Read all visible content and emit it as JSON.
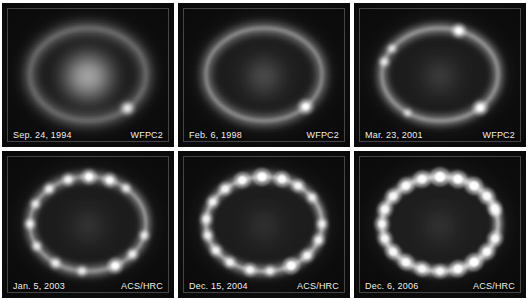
{
  "figure": {
    "name": "supernova-1987a-ring-evolution-montage",
    "background_color": "#ffffff",
    "panel_background_color": "#050505",
    "label_color": "#f2f2f2",
    "grid": {
      "columns": 3,
      "rows": 2
    }
  },
  "panels": [
    {
      "id": "panel-1",
      "date": "Sep. 24, 1994",
      "instrument": "WFPC2",
      "ring": {
        "center_glow": true,
        "center_glow_intensity": 0.95,
        "ring_brightness": 0.42,
        "ring_blur": 5.2,
        "knot_count": 1,
        "knots": [
          {
            "angle": 47,
            "size": 4.0,
            "intensity": 0.95
          }
        ]
      }
    },
    {
      "id": "panel-2",
      "date": "Feb. 6, 1998",
      "instrument": "WFPC2",
      "ring": {
        "center_glow": true,
        "center_glow_intensity": 0.4,
        "ring_brightness": 0.5,
        "ring_blur": 4.0,
        "knot_count": 1,
        "knots": [
          {
            "angle": 44,
            "size": 4.4,
            "intensity": 1.0
          }
        ]
      }
    },
    {
      "id": "panel-3",
      "date": "Mar. 23, 2001",
      "instrument": "WFPC2",
      "ring": {
        "center_glow": true,
        "center_glow_intensity": 0.26,
        "ring_brightness": 0.52,
        "ring_blur": 3.6,
        "knot_count": 5,
        "knots": [
          {
            "angle": 289,
            "size": 4.2,
            "intensity": 1.0
          },
          {
            "angle": 46,
            "size": 4.4,
            "intensity": 1.0
          },
          {
            "angle": 196,
            "size": 3.4,
            "intensity": 0.72
          },
          {
            "angle": 214,
            "size": 3.2,
            "intensity": 0.68
          },
          {
            "angle": 124,
            "size": 3.0,
            "intensity": 0.6
          }
        ]
      }
    },
    {
      "id": "panel-4",
      "date": "Jan. 5, 2003",
      "instrument": "ACS/HRC",
      "ring": {
        "center_glow": true,
        "center_glow_intensity": 0.18,
        "ring_brightness": 0.5,
        "ring_blur": 3.0,
        "knot_count": 13,
        "knots": [
          {
            "angle": 271,
            "size": 4.4,
            "intensity": 1.0
          },
          {
            "angle": 292,
            "size": 4.2,
            "intensity": 0.95
          },
          {
            "angle": 250,
            "size": 3.8,
            "intensity": 0.85
          },
          {
            "angle": 311,
            "size": 3.4,
            "intensity": 0.72
          },
          {
            "angle": 228,
            "size": 3.6,
            "intensity": 0.8
          },
          {
            "angle": 205,
            "size": 3.4,
            "intensity": 0.72
          },
          {
            "angle": 180,
            "size": 3.6,
            "intensity": 0.8
          },
          {
            "angle": 152,
            "size": 3.4,
            "intensity": 0.7
          },
          {
            "angle": 124,
            "size": 3.6,
            "intensity": 0.78
          },
          {
            "angle": 96,
            "size": 3.4,
            "intensity": 0.72
          },
          {
            "angle": 62,
            "size": 4.4,
            "intensity": 1.0
          },
          {
            "angle": 40,
            "size": 3.6,
            "intensity": 0.78
          },
          {
            "angle": 14,
            "size": 3.4,
            "intensity": 0.72
          }
        ]
      }
    },
    {
      "id": "panel-5",
      "date": "Dec. 15, 2004",
      "instrument": "ACS/HRC",
      "ring": {
        "center_glow": true,
        "center_glow_intensity": 0.16,
        "ring_brightness": 0.58,
        "ring_blur": 2.8,
        "knot_count": 17,
        "knots": [
          {
            "angle": 268,
            "size": 5.0,
            "intensity": 1.0
          },
          {
            "angle": 288,
            "size": 4.6,
            "intensity": 0.95
          },
          {
            "angle": 248,
            "size": 4.6,
            "intensity": 0.95
          },
          {
            "angle": 306,
            "size": 4.0,
            "intensity": 0.85
          },
          {
            "angle": 326,
            "size": 3.6,
            "intensity": 0.74
          },
          {
            "angle": 228,
            "size": 4.0,
            "intensity": 0.85
          },
          {
            "angle": 208,
            "size": 3.8,
            "intensity": 0.8
          },
          {
            "angle": 186,
            "size": 3.8,
            "intensity": 0.8
          },
          {
            "angle": 166,
            "size": 3.6,
            "intensity": 0.74
          },
          {
            "angle": 146,
            "size": 3.8,
            "intensity": 0.8
          },
          {
            "angle": 126,
            "size": 3.8,
            "intensity": 0.8
          },
          {
            "angle": 104,
            "size": 4.0,
            "intensity": 0.85
          },
          {
            "angle": 84,
            "size": 3.6,
            "intensity": 0.74
          },
          {
            "angle": 62,
            "size": 4.8,
            "intensity": 1.0
          },
          {
            "angle": 42,
            "size": 4.0,
            "intensity": 0.85
          },
          {
            "angle": 20,
            "size": 3.8,
            "intensity": 0.8
          },
          {
            "angle": 0,
            "size": 3.6,
            "intensity": 0.74
          }
        ]
      }
    },
    {
      "id": "panel-6",
      "date": "Dec. 6, 2006",
      "instrument": "ACS/HRC",
      "ring": {
        "center_glow": true,
        "center_glow_intensity": 0.16,
        "ring_brightness": 0.66,
        "ring_blur": 2.6,
        "knot_count": 20,
        "knots": [
          {
            "angle": 270,
            "size": 5.4,
            "intensity": 1.0
          },
          {
            "angle": 288,
            "size": 5.0,
            "intensity": 1.0
          },
          {
            "angle": 252,
            "size": 4.8,
            "intensity": 0.95
          },
          {
            "angle": 306,
            "size": 5.0,
            "intensity": 1.0
          },
          {
            "angle": 324,
            "size": 4.6,
            "intensity": 0.92
          },
          {
            "angle": 234,
            "size": 4.6,
            "intensity": 0.92
          },
          {
            "angle": 216,
            "size": 4.4,
            "intensity": 0.88
          },
          {
            "angle": 198,
            "size": 4.4,
            "intensity": 0.88
          },
          {
            "angle": 180,
            "size": 4.2,
            "intensity": 0.86
          },
          {
            "angle": 162,
            "size": 4.2,
            "intensity": 0.86
          },
          {
            "angle": 144,
            "size": 4.4,
            "intensity": 0.88
          },
          {
            "angle": 126,
            "size": 4.6,
            "intensity": 0.92
          },
          {
            "angle": 108,
            "size": 4.4,
            "intensity": 0.88
          },
          {
            "angle": 90,
            "size": 4.2,
            "intensity": 0.86
          },
          {
            "angle": 72,
            "size": 4.8,
            "intensity": 0.95
          },
          {
            "angle": 54,
            "size": 5.0,
            "intensity": 1.0
          },
          {
            "angle": 36,
            "size": 4.6,
            "intensity": 0.92
          },
          {
            "angle": 18,
            "size": 4.4,
            "intensity": 0.88
          },
          {
            "angle": 340,
            "size": 4.2,
            "intensity": 0.86
          },
          {
            "angle": 344,
            "size": 3.8,
            "intensity": 0.8
          }
        ]
      }
    }
  ]
}
